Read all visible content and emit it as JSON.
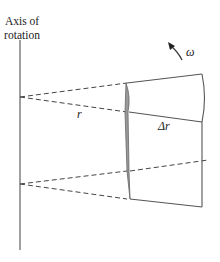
{
  "labels": {
    "axis_line1": "Axis of",
    "axis_line2": "rotation",
    "r": "r",
    "delta_r": "Δr",
    "omega": "ω"
  },
  "colors": {
    "line": "#555555",
    "dashed": "#444444",
    "element_shade": "#9a9a9a"
  }
}
